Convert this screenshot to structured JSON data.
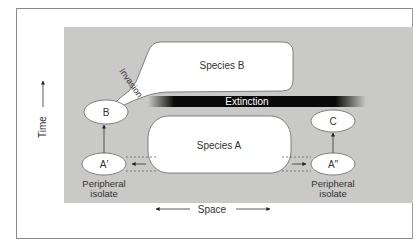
{
  "diagram": {
    "type": "peripatric speciation diagram",
    "axes": {
      "y_label": "Time",
      "x_label": "Space"
    },
    "nodes": {
      "species_b": "Species B",
      "species_a": "Species A",
      "b": "B",
      "c": "C",
      "a_prime": "A′",
      "a_double_prime": "A″"
    },
    "annotations": {
      "invasion": "Invasion",
      "extinction": "Extinction",
      "peripheral_left_line1": "Peripheral",
      "peripheral_left_line2": "isolate",
      "peripheral_right_line1": "Peripheral",
      "peripheral_right_line2": "isolate"
    },
    "colors": {
      "background_panel": "#c9c9c7",
      "shape_fill": "#ffffff",
      "stroke": "#555555",
      "extinction_bar": "#0a0a0a"
    }
  }
}
